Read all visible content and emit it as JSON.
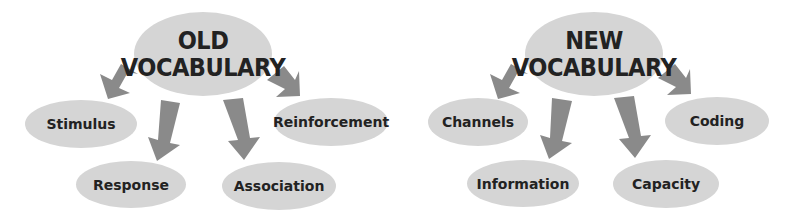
{
  "colors": {
    "bubble": "#d5d5d5",
    "arrow": "#8a8a8a",
    "text": "#222222"
  },
  "diagrams": [
    {
      "title_line1": "OLD",
      "title_line2": "VOCABULARY",
      "nodes": [
        "Stimulus",
        "Response",
        "Association",
        "Reinforcement"
      ]
    },
    {
      "title_line1": "NEW",
      "title_line2": "VOCABULARY",
      "nodes": [
        "Channels",
        "Information",
        "Capacity",
        "Coding"
      ]
    }
  ]
}
